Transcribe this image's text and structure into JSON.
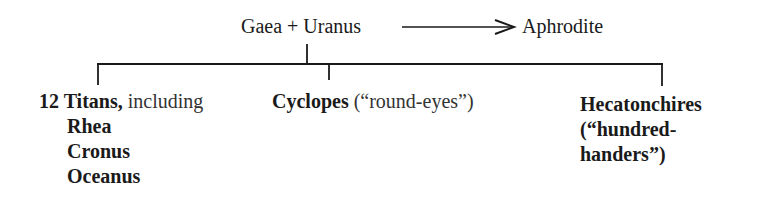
{
  "top": {
    "parents": "Gaea + Uranus",
    "arrow_target": "Aphrodite"
  },
  "children": [
    {
      "name": "12 Titans,",
      "suffix": " including",
      "members": [
        "Rhea",
        "Cronus",
        "Oceanus"
      ]
    },
    {
      "name": "Cyclopes",
      "suffix": " (“round-eyes”)"
    },
    {
      "name_lines": [
        "Hecatonchires",
        "(“hundred-",
        "handers”)"
      ]
    }
  ],
  "colors": {
    "ink": "#1a1a1a",
    "background": "#ffffff"
  }
}
